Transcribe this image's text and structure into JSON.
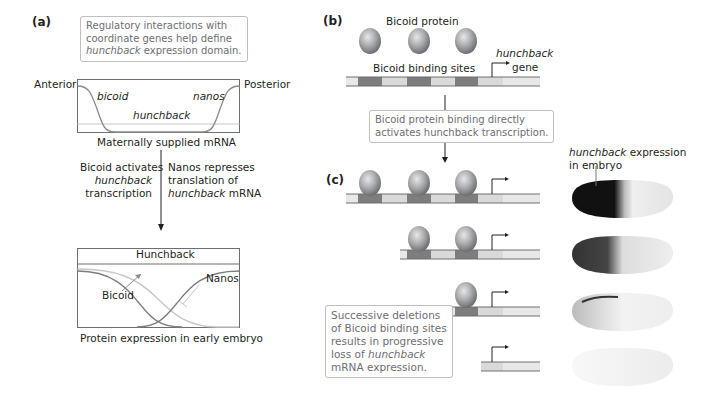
{
  "panel_a": {
    "label": "(a)",
    "callout": {
      "line1": "Regulatory interactions with",
      "line2": "coordinate genes help define",
      "line3_italic": "hunchback",
      "line3_rest": " expression domain."
    },
    "mrna_plot": {
      "left_label": "Anterior",
      "right_label": "Posterior",
      "curve_labels": {
        "bicoid": "bicoid",
        "nanos": "nanos",
        "hunchback": "hunchback"
      },
      "caption": "Maternally supplied mRNA"
    },
    "arrow_left_text": {
      "line1": "Bicoid activates",
      "line2_italic": "hunchback",
      "line3": "transcription"
    },
    "arrow_right_text": {
      "line1": "Nanos represses",
      "line2": "translation of",
      "line3_italic": "hunchback",
      "line3_rest": " mRNA"
    },
    "protein_plot": {
      "title": "Hunchback",
      "labels": {
        "bicoid": "Bicoid",
        "nanos": "Nanos"
      },
      "caption": "Protein expression in early embryo"
    }
  },
  "panel_b": {
    "label": "(b)",
    "protein_label": "Bicoid protein",
    "sites_label": "Bicoid binding sites",
    "gene_label_italic": "hunchback",
    "gene_label": "gene",
    "callout": {
      "line1": "Bicoid protein binding directly",
      "line2": "activates hunchback transcription."
    }
  },
  "panel_c": {
    "label": "(c)",
    "embryo_label": {
      "line1_italic": "hunchback",
      "line1_rest": " expression",
      "line2": "in embryo"
    },
    "callout": {
      "line1": "Successive deletions",
      "line2": "of Bicoid binding sites",
      "line3": "results in progressive",
      "line4_prefix": "loss of ",
      "line4_italic": "hunchback",
      "line5": "mRNA expression."
    },
    "rows": [
      {
        "binding_sites": 3,
        "expression": "strong"
      },
      {
        "binding_sites": 2,
        "expression": "reduced"
      },
      {
        "binding_sites": 1,
        "expression": "weak"
      },
      {
        "binding_sites": 0,
        "expression": "none"
      }
    ]
  },
  "colors": {
    "curve": "#8a8a8a",
    "hunchback_line": "#c8c8c8",
    "site_dark": "#7d7d7d",
    "site_light": "#d9d9d9",
    "dna_line": "#6d6e71",
    "sphere": "#a7a9ac",
    "callout_border": "#bfbfbf"
  }
}
